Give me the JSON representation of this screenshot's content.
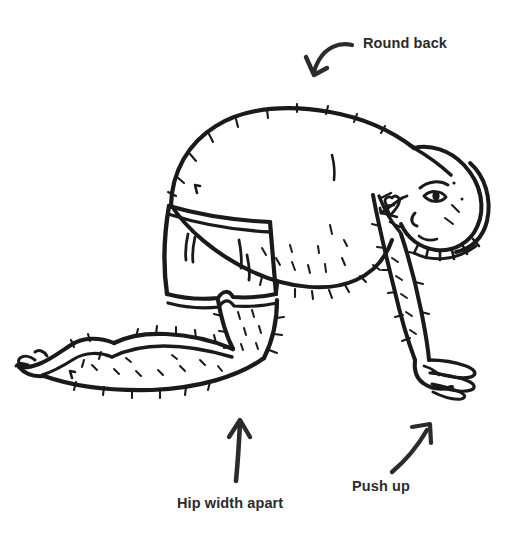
{
  "illustration": {
    "title": "Quadruped tabletop exercise position",
    "subject": "person on hands and knees, side view, wearing shorts",
    "style": "hand-drawn black ink line art on white background",
    "background_color": "#ffffff",
    "ink_color": "#1a1a1a"
  },
  "annotations": [
    {
      "id": "round-back",
      "label": "Round back",
      "arrow": "curved-arrow-down-left",
      "arrow_name": "round-back-arrow-icon",
      "points_to": "upper back / spine"
    },
    {
      "id": "hip-width-apart",
      "label": "Hip width apart",
      "arrow": "straight-arrow-up",
      "arrow_name": "hip-width-arrow-icon",
      "points_to": "knees"
    },
    {
      "id": "push-up",
      "label": "Push up",
      "arrow": "curved-arrow-up-right",
      "arrow_name": "push-up-arrow-icon",
      "points_to": "supporting hand"
    }
  ],
  "label_color": "#2b2b2b"
}
